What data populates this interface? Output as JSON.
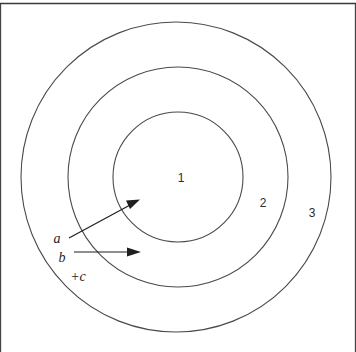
{
  "figure": {
    "background_color": "#ffffff",
    "line_color": "#4a4a4a",
    "text_color": "#1f1f1f",
    "width": 356,
    "height": 352
  },
  "frame": {
    "top_rule": true,
    "left_rule": true,
    "right_rule": true,
    "bottom_rule": false
  },
  "rings": [
    {
      "label": "1",
      "name": "inner-ring",
      "cx": 178,
      "cy": 177,
      "r": 65,
      "label_x": 181,
      "label_y": 182
    },
    {
      "label": "2",
      "name": "middle-ring",
      "cx": 178,
      "cy": 177,
      "r": 110,
      "label_x": 263,
      "label_y": 207
    },
    {
      "label": "3",
      "name": "outer-ring",
      "cx": 176,
      "cy": 177,
      "r": 155,
      "label_x": 312,
      "label_y": 217
    }
  ],
  "callouts": [
    {
      "label": "a",
      "name": "callout-a",
      "label_x": 57,
      "label_y": 243,
      "line": {
        "x1": 69,
        "y1": 238,
        "x2": 131,
        "y2": 204
      },
      "head": {
        "tip_x": 139,
        "tip_y": 200,
        "angle_deg": -28.8
      }
    },
    {
      "label": "b",
      "name": "callout-b",
      "label_x": 62,
      "label_y": 262,
      "line": {
        "x1": 74,
        "y1": 252,
        "x2": 130,
        "y2": 252
      },
      "head": {
        "tip_x": 140,
        "tip_y": 252,
        "angle_deg": 0
      }
    },
    {
      "label": "+c",
      "name": "callout-c",
      "label_x": 78,
      "label_y": 281,
      "line": null,
      "head": null
    }
  ]
}
